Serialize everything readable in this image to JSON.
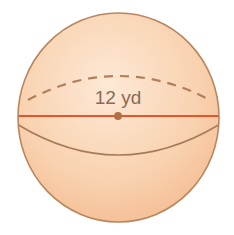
{
  "figure": {
    "shape": "sphere",
    "diameter_label": "12 yd",
    "colors": {
      "fill_top": "#fbe3cd",
      "fill_bottom": "#f6c196",
      "outline": "#b8865e",
      "diameter_line": "#e8542a",
      "center_dot": "#b0714a",
      "label": "#8a6a55"
    }
  }
}
